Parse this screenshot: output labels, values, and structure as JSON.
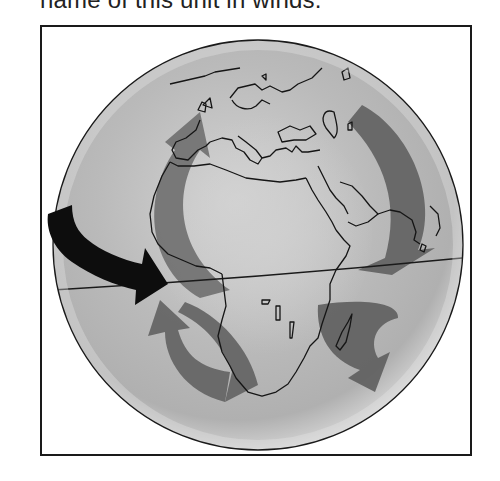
{
  "caption": {
    "text": "name of this unit in winds."
  },
  "figure": {
    "type": "globe-wind-diagram",
    "elements": {
      "globe": "shaded sphere with continent outlines (Europe, Africa, Arabia, India, Madagascar)",
      "equator": "thin line across the globe",
      "rotation_arrow": "black curved arrow on left pointing east toward the equator",
      "circulation_arrows": [
        {
          "position": "northwest (Atlantic)",
          "direction": "curving north"
        },
        {
          "position": "northeast (Indian Ocean/Arabia)",
          "direction": "curving south-west"
        },
        {
          "position": "southwest (South Atlantic)",
          "direction": "curving north"
        },
        {
          "position": "southeast (Indian Ocean near Madagascar)",
          "direction": "curving south"
        }
      ]
    },
    "colors": {
      "globe_fill": "#bdbdbd",
      "arrow_gray": "#6a6a6a",
      "rotation_arrow": "#0d0d0d",
      "outline": "#1a1a1a"
    }
  }
}
